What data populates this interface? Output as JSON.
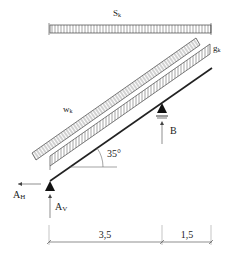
{
  "diagram": {
    "type": "structural-load-diagram",
    "loads": {
      "snow": {
        "symbol": "S",
        "subscript": "k"
      },
      "wind": {
        "symbol": "w",
        "subscript": "k"
      },
      "dead": {
        "symbol": "g",
        "subscript": "k"
      }
    },
    "angle": {
      "label": "35°"
    },
    "supports": {
      "left": {
        "horizontal_reaction": {
          "symbol": "A",
          "subscript": "H"
        },
        "vertical_reaction": {
          "symbol": "A",
          "subscript": "V"
        }
      },
      "right": {
        "reaction": {
          "symbol": "B"
        }
      }
    },
    "dimensions": [
      {
        "label": "3,5"
      },
      {
        "label": "1,5"
      }
    ],
    "colors": {
      "line": "#222222",
      "hatch": "#555555",
      "background": "#ffffff"
    }
  }
}
